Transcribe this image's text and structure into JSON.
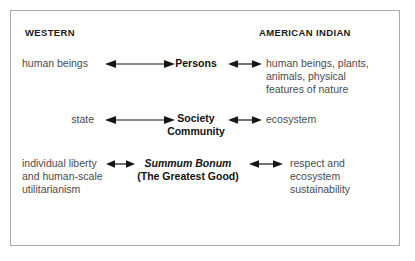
{
  "diagram": {
    "title_columns": {
      "left": "WESTERN",
      "right": "AMERICAN INDIAN"
    },
    "rows": [
      {
        "id": "persons",
        "left": "human beings",
        "center": "Persons",
        "center_sub": "",
        "right": "human beings, plants,\nanimals, physical\nfeatures of nature",
        "left_arrow": "double-headed-arrow-long",
        "right_arrow": "double-headed-arrow-short"
      },
      {
        "id": "society",
        "left": "state",
        "center": "Society",
        "center_sub": "Community",
        "right": "ecosystem",
        "left_arrow": "double-headed-arrow-long",
        "right_arrow": "double-headed-arrow-short"
      },
      {
        "id": "summum-bonum",
        "left": "individual liberty\nand human-scale\nutilitarianism",
        "center": "Summum Bonum",
        "center_sub": "(The Greatest Good)",
        "right": "respect and\necosystem\nsustainability",
        "left_arrow": "double-headed-arrow-tiny",
        "right_arrow": "double-headed-arrow-short"
      }
    ],
    "row_text": {
      "r1_left": "human beings",
      "r1_center": "Persons",
      "r1_right_line1": "human beings, plants,",
      "r1_right_line2": "animals, physical",
      "r1_right_line3": "features of nature",
      "r2_left": "state",
      "r2_center": "Society",
      "r2_center_sub": "Community",
      "r2_right": "ecosystem",
      "r3_left_line1": "individual liberty",
      "r3_left_line2": "and human-scale",
      "r3_left_line3": "utilitarianism",
      "r3_center": "Summum Bonum",
      "r3_center_sub": "(The Greatest Good)",
      "r3_right_line1": "respect and",
      "r3_right_line2": "ecosystem",
      "r3_right_line3": "sustainability"
    },
    "colors": {
      "border": "#aaaaac",
      "heading_text": "#1b1b1b",
      "body_text": "#4b4b4d",
      "emphasis_text": "#121212",
      "arrow": "#151515",
      "background": "#ffffff"
    },
    "icons": {
      "double_arrow": "double-headed-arrow"
    }
  }
}
